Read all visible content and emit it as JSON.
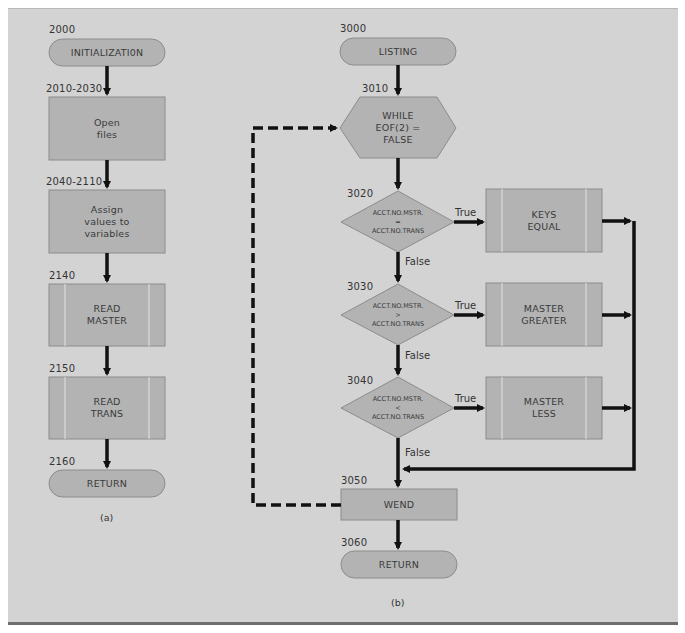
{
  "colors": {
    "panel_bg": "#d3d3d3",
    "shape_fill": "#b3b3b3",
    "shape_stroke": "#8c8c8c",
    "arrow": "#111111"
  },
  "diagram_a": {
    "caption": "(a)",
    "nodes": [
      {
        "id": "2000",
        "shape": "terminal",
        "label": "INITIALIZATI0N"
      },
      {
        "id": "2010-2030",
        "shape": "process",
        "label": "Open\nfiles"
      },
      {
        "id": "2040-2110",
        "shape": "process",
        "label": "Assign\nvalues to\nvariables"
      },
      {
        "id": "2140",
        "shape": "predefined-process",
        "label": "READ\nMASTER"
      },
      {
        "id": "2150",
        "shape": "predefined-process",
        "label": "READ\nTRANS"
      },
      {
        "id": "2160",
        "shape": "terminal",
        "label": "RETURN"
      }
    ]
  },
  "diagram_b": {
    "caption": "(b)",
    "nodes": [
      {
        "id": "3000",
        "shape": "terminal",
        "label": "LISTING"
      },
      {
        "id": "3010",
        "shape": "loop-hexagon",
        "label": "WHILE\nEOF(2) =\nFALSE"
      },
      {
        "id": "3020",
        "shape": "decision",
        "label": "ACCT.NO.MSTR.\n=\nACCT.NO.TRANS"
      },
      {
        "id": "3030",
        "shape": "decision",
        "label": "ACCT.NO.MSTR.\n>\nACCT.NO.TRANS"
      },
      {
        "id": "3040",
        "shape": "decision",
        "label": "ACCT.NO.MSTR.\n<\nACCT.NO.TRANS"
      },
      {
        "id": "3050",
        "shape": "process",
        "label": "WEND"
      },
      {
        "id": "3060",
        "shape": "terminal",
        "label": "RETURN"
      }
    ],
    "branches": [
      {
        "from": "3020",
        "true_label": "True",
        "false_label": "False",
        "target_label": "KEYS\nEQUAL"
      },
      {
        "from": "3030",
        "true_label": "True",
        "false_label": "False",
        "target_label": "MASTER\nGREATER"
      },
      {
        "from": "3040",
        "true_label": "True",
        "false_label": "False",
        "target_label": "MASTER\nLESS"
      }
    ]
  }
}
